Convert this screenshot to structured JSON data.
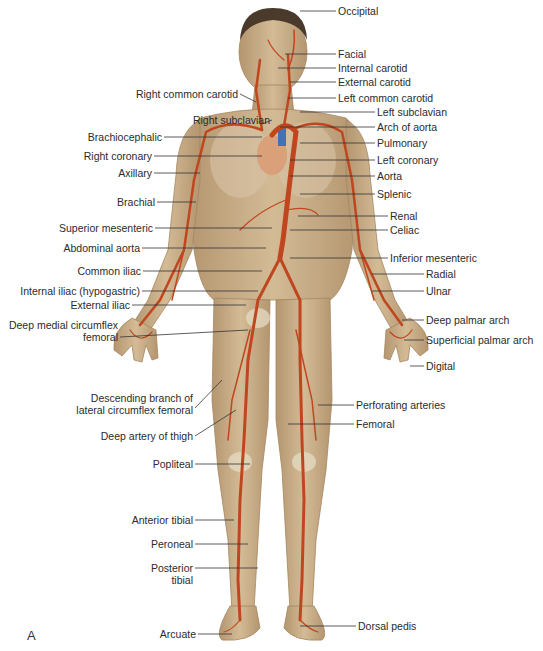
{
  "figure": {
    "panel_letter": "A",
    "colors": {
      "skin": "#c9b08a",
      "skin_shadow": "#a98c66",
      "artery": "#c0461f",
      "vein_blue": "#4a6db8",
      "bone": "#e6dcc4",
      "leader_line": "#333333",
      "hair": "#4a3a2c"
    },
    "labels_right": [
      {
        "text": "Occipital",
        "x": 338,
        "y": 5
      },
      {
        "text": "Facial",
        "x": 338,
        "y": 48
      },
      {
        "text": "Internal carotid",
        "x": 338,
        "y": 62
      },
      {
        "text": "External carotid",
        "x": 338,
        "y": 76
      },
      {
        "text": "Left common carotid",
        "x": 338,
        "y": 92
      },
      {
        "text": "Left subclavian",
        "x": 377,
        "y": 106
      },
      {
        "text": "Arch of aorta",
        "x": 377,
        "y": 121
      },
      {
        "text": "Pulmonary",
        "x": 377,
        "y": 137
      },
      {
        "text": "Left coronary",
        "x": 377,
        "y": 154
      },
      {
        "text": "Aorta",
        "x": 377,
        "y": 170
      },
      {
        "text": "Splenic",
        "x": 377,
        "y": 188
      },
      {
        "text": "Renal",
        "x": 390,
        "y": 210
      },
      {
        "text": "Celiac",
        "x": 390,
        "y": 224
      },
      {
        "text": "Inferior mesenteric",
        "x": 390,
        "y": 252
      },
      {
        "text": "Radial",
        "x": 426,
        "y": 268
      },
      {
        "text": "Ulnar",
        "x": 426,
        "y": 285
      },
      {
        "text": "Deep palmar arch",
        "x": 426,
        "y": 314
      },
      {
        "text": "Superficial palmar arch",
        "x": 426,
        "y": 334
      },
      {
        "text": "Digital",
        "x": 426,
        "y": 360
      },
      {
        "text": "Perforating arteries",
        "x": 356,
        "y": 399
      },
      {
        "text": "Femoral",
        "x": 356,
        "y": 418
      },
      {
        "text": "Dorsal pedis",
        "x": 358,
        "y": 620
      }
    ],
    "labels_left": [
      {
        "text": "Right common carotid",
        "right": 238,
        "y": 88
      },
      {
        "text": "Right subclavian",
        "right": 270,
        "y": 114
      },
      {
        "text": "Brachiocephalic",
        "right": 162,
        "y": 131
      },
      {
        "text": "Right coronary",
        "right": 152,
        "y": 150
      },
      {
        "text": "Axillary",
        "right": 152,
        "y": 167
      },
      {
        "text": "Brachial",
        "right": 155,
        "y": 196
      },
      {
        "text": "Superior mesenteric",
        "right": 153,
        "y": 222
      },
      {
        "text": "Abdominal aorta",
        "right": 140,
        "y": 242
      },
      {
        "text": "Common iliac",
        "right": 141,
        "y": 265
      },
      {
        "text": "Internal iliac (hypogastric)",
        "right": 140,
        "y": 285
      },
      {
        "text": "External iliac",
        "right": 130,
        "y": 299
      },
      {
        "text": "Deep medial circumflex",
        "right": 118,
        "y": 319
      },
      {
        "text": "femoral",
        "right": 118,
        "y": 331
      },
      {
        "text": "Descending branch of",
        "right": 193,
        "y": 392
      },
      {
        "text": "lateral circumflex femoral",
        "right": 193,
        "y": 404
      },
      {
        "text": "Deep artery of thigh",
        "right": 193,
        "y": 430
      },
      {
        "text": "Popliteal",
        "right": 193,
        "y": 458
      },
      {
        "text": "Anterior tibial",
        "right": 193,
        "y": 514
      },
      {
        "text": "Peroneal",
        "right": 193,
        "y": 538
      },
      {
        "text": "Posterior",
        "right": 193,
        "y": 562
      },
      {
        "text": "tibial",
        "right": 193,
        "y": 574
      },
      {
        "text": "Arcuate",
        "right": 196,
        "y": 628
      }
    ]
  }
}
